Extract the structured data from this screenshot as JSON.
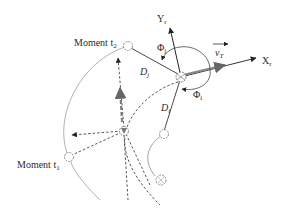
{
  "labels": {
    "moment_t2": "Moment t",
    "moment_t2_sub": "2",
    "moment_t1": "Moment t",
    "moment_t1_sub": "1",
    "y_axis": "Y",
    "y_axis_sub": "r",
    "x_axis": "X",
    "x_axis_sub": "r",
    "velocity": "v",
    "velocity_sub": "T",
    "phi_j": "Φ",
    "phi_j_sub": "j",
    "phi_i": "Φ",
    "phi_i_sub": "i",
    "d_j": "D",
    "d_j_sub": "j",
    "d_i": "D",
    "d_i_sub": "i"
  },
  "colors": {
    "stroke": "#333333",
    "light_stroke": "#9a9a9a",
    "robot": "#7a7a7a"
  }
}
